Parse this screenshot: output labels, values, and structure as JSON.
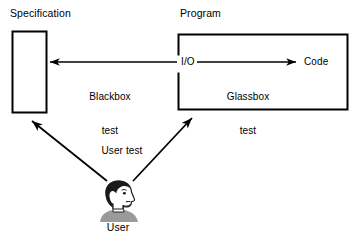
{
  "diagram": {
    "boxes": [
      {
        "id": "specification",
        "label": "Specification",
        "x": 12,
        "y": 31,
        "w": 34,
        "h": 81
      },
      {
        "id": "program",
        "label": "Program",
        "x": 178,
        "y": 34,
        "w": 170,
        "h": 76
      }
    ],
    "inner_labels": {
      "io": "I/O",
      "code": "Code"
    },
    "edges": [
      {
        "id": "blackbox",
        "label_line1": "Blackbox",
        "label_line2": "test",
        "direction": "left",
        "from": "I/O",
        "to": "Specification"
      },
      {
        "id": "glassbox",
        "label_line1": "Glassbox",
        "label_line2": "test",
        "direction": "right",
        "from": "I/O",
        "to": "Code"
      },
      {
        "id": "user-test-spec",
        "label": "User test",
        "direction": "up-left",
        "from": "User",
        "to": "Specification"
      },
      {
        "id": "user-test-program",
        "label": "User test",
        "direction": "up-right",
        "from": "User",
        "to": "Program"
      }
    ],
    "actor": {
      "label": "User",
      "icon": "person-head-profile-icon"
    },
    "colors": {
      "stroke": "#000000",
      "background": "#ffffff",
      "hair": "#1a1a1a",
      "skin": "#ffffff",
      "shoulders": "#9a9a9a"
    }
  }
}
